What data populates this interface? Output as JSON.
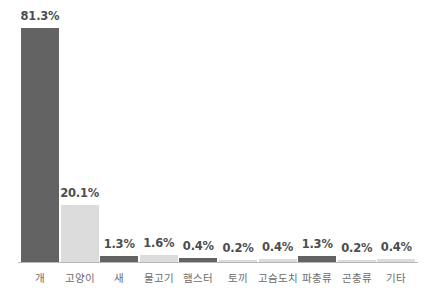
{
  "chart_data": {
    "type": "bar",
    "title": "",
    "subtitle": "",
    "xlabel": "",
    "ylabel": "",
    "ylim": [
      0,
      90
    ],
    "grid": false,
    "legend": null,
    "categories": [
      "개",
      "고양이",
      "새",
      "물고기",
      "햄스터",
      "토끼",
      "고슴도치",
      "파충류",
      "곤충류",
      "기타"
    ],
    "values": [
      81.3,
      20.1,
      1.3,
      1.6,
      0.4,
      0.2,
      0.4,
      1.3,
      0.2,
      0.4
    ],
    "value_labels": [
      "81.3%",
      "20.1%",
      "1.3%",
      "1.6%",
      "0.4%",
      "0.2%",
      "0.4%",
      "1.3%",
      "0.2%",
      "0.4%"
    ],
    "bar_shades": [
      "dark",
      "light",
      "dark",
      "light",
      "dark",
      "light",
      "light",
      "dark",
      "light",
      "light"
    ],
    "colors": {
      "bar_dark": "#636363",
      "bar_light": "#dcdcdc",
      "axis": "#b8b8b8",
      "value_text": "#4d4d4d",
      "category_text": "#6b6b6b",
      "background": "#ffffff"
    }
  }
}
